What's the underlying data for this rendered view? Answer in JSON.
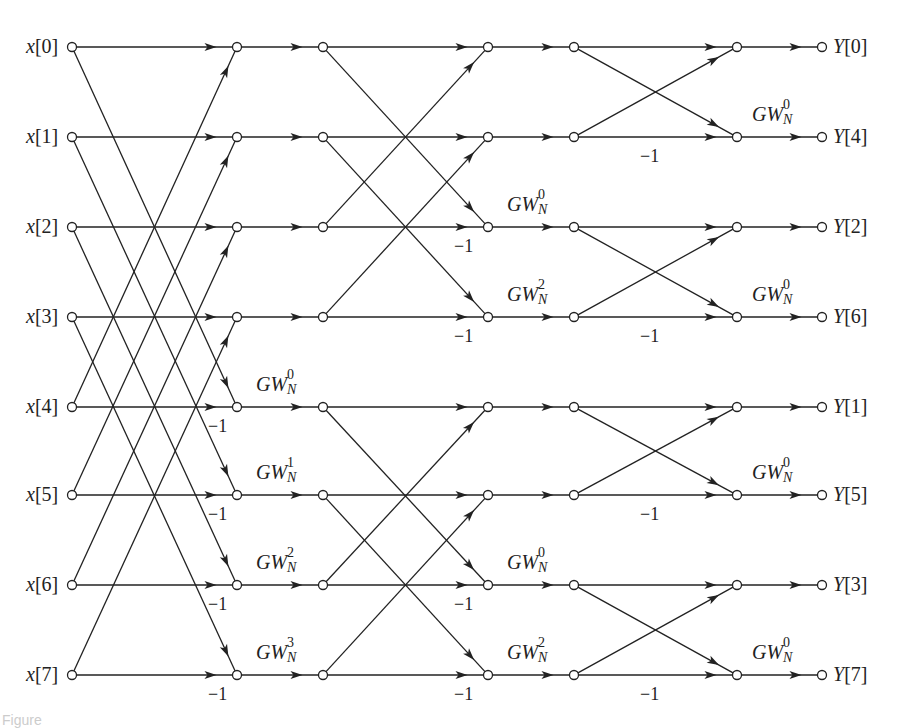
{
  "diagram": {
    "type": "signal-flow-graph",
    "inputs": [
      "x[0]",
      "x[1]",
      "x[2]",
      "x[3]",
      "x[4]",
      "x[5]",
      "x[6]",
      "x[7]"
    ],
    "outputs": [
      "Y[0]",
      "Y[4]",
      "Y[2]",
      "Y[6]",
      "Y[1]",
      "Y[5]",
      "Y[3]",
      "Y[7]"
    ],
    "rows_y": [
      47,
      137,
      227,
      317,
      407,
      495,
      585,
      675
    ],
    "columns_x": {
      "input": 72,
      "s1": 237,
      "s1b": 323,
      "s2": 488,
      "s2b": 574,
      "s3": 737,
      "output": 822
    },
    "stage1_twiddles": [
      {
        "row": 4,
        "base": "GW",
        "sub": "N",
        "sup": "0"
      },
      {
        "row": 5,
        "base": "GW",
        "sub": "N",
        "sup": "1"
      },
      {
        "row": 6,
        "base": "GW",
        "sub": "N",
        "sup": "2"
      },
      {
        "row": 7,
        "base": "GW",
        "sub": "N",
        "sup": "3"
      }
    ],
    "stage2_twiddles": [
      {
        "row": 2,
        "base": "GW",
        "sub": "N",
        "sup": "0"
      },
      {
        "row": 3,
        "base": "GW",
        "sub": "N",
        "sup": "2"
      },
      {
        "row": 6,
        "base": "GW",
        "sub": "N",
        "sup": "0"
      },
      {
        "row": 7,
        "base": "GW",
        "sub": "N",
        "sup": "2"
      }
    ],
    "stage3_twiddles": [
      {
        "row": 1,
        "base": "GW",
        "sub": "N",
        "sup": "0"
      },
      {
        "row": 3,
        "base": "GW",
        "sub": "N",
        "sup": "0"
      },
      {
        "row": 5,
        "base": "GW",
        "sub": "N",
        "sup": "0"
      },
      {
        "row": 7,
        "base": "GW",
        "sub": "N",
        "sup": "0"
      }
    ],
    "negation_label": "−1",
    "caption_fragment": "Figure"
  }
}
